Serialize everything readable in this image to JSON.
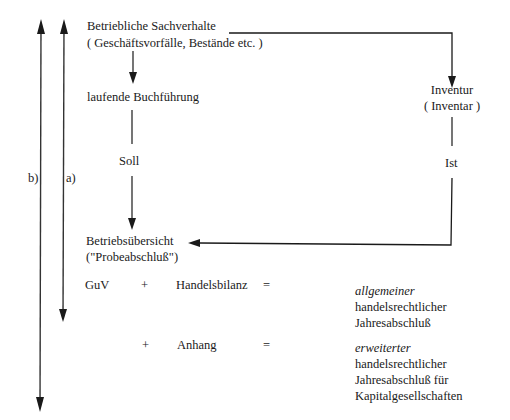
{
  "nodes": {
    "sachverhalte": {
      "line1": "Betriebliche Sachverhalte",
      "line2": "( Geschäftsvorfälle, Bestände etc. )"
    },
    "buchfuehrung": "laufende Buchführung",
    "inventur": {
      "line1": "Inventur",
      "line2": "( Inventar )"
    },
    "soll": "Soll",
    "ist": "Ist",
    "betriebsuebersicht": {
      "line1": "Betriebsübersicht",
      "line2": "(\"Probeabschluß\")"
    }
  },
  "brackets": {
    "a": "a)",
    "b": "b)"
  },
  "equations": {
    "row1": {
      "term1": "GuV",
      "plus": "+",
      "term2": "Handelsbilanz",
      "equals": "=",
      "result_italic": "allgemeiner",
      "result_line2": "handelsrechtlicher",
      "result_line3": "Jahresabschluß"
    },
    "row2": {
      "plus": "+",
      "term": "Anhang",
      "equals": "=",
      "result_italic": "erweiterter",
      "result_line2": "handelsrechtlicher",
      "result_line3": "Jahresabschluß für",
      "result_line4": "Kapitalgesellschaften"
    }
  },
  "colors": {
    "line": "#1a1a1a",
    "text": "#1a1a1a",
    "background": "#ffffff"
  }
}
